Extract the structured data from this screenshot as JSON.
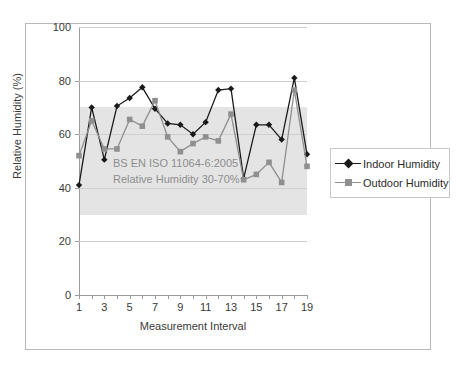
{
  "chart_data": {
    "type": "line",
    "title": "",
    "xlabel": "Measurement Interval",
    "ylabel": "Relative Humidity (%)",
    "xlim": [
      1,
      19
    ],
    "ylim": [
      0,
      100
    ],
    "yticks": [
      0,
      20,
      40,
      60,
      80,
      100
    ],
    "xticks": [
      1,
      2,
      3,
      4,
      5,
      6,
      7,
      8,
      9,
      10,
      11,
      12,
      13,
      14,
      15,
      16,
      17,
      18,
      19
    ],
    "xtick_labels": [
      "1",
      "",
      "3",
      "",
      "5",
      "",
      "7",
      "",
      "9",
      "",
      "11",
      "",
      "13",
      "",
      "15",
      "",
      "17",
      "",
      "19"
    ],
    "grid": true,
    "legend_position": "right",
    "x": [
      1,
      2,
      3,
      4,
      5,
      6,
      7,
      8,
      9,
      10,
      11,
      12,
      13,
      14,
      15,
      16,
      17,
      18,
      19
    ],
    "series": [
      {
        "name": "Indoor Humidity",
        "color": "#1a1a1a",
        "marker": "diamond",
        "values": [
          41,
          70,
          50.5,
          70.5,
          73.5,
          77.5,
          69.5,
          64,
          63.5,
          60,
          64.5,
          76.5,
          77,
          43.5,
          63.5,
          63.5,
          58,
          81,
          52.5
        ]
      },
      {
        "name": "Outdoor Humidity",
        "color": "#8f8f8f",
        "marker": "square",
        "values": [
          52,
          65,
          54.5,
          54.5,
          65.5,
          63,
          72.5,
          59,
          53.5,
          56.5,
          59,
          57.5,
          67.5,
          43,
          45,
          49.5,
          42,
          76.5,
          48
        ]
      }
    ],
    "bands": [
      {
        "label": "BS EN ISO 11064-6:2005 Relative Humidity 30-70%",
        "ymin": 30,
        "ymax": 70,
        "color": "#d4d4d4"
      }
    ],
    "annotations": [
      {
        "text": "BS EN ISO 11064-6:2005",
        "color": "#8d8d8d"
      },
      {
        "text": "Relative Humidity 30-70%",
        "color": "#8d8d8d"
      }
    ]
  },
  "legend": {
    "entries": [
      {
        "label": "Indoor Humidity"
      },
      {
        "label": "Outdoor Humidity"
      }
    ]
  }
}
